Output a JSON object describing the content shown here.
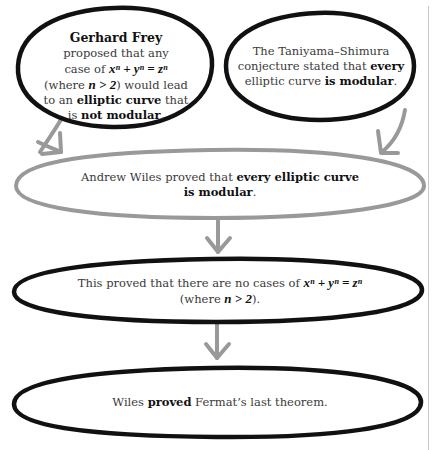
{
  "colors": {
    "black_outline": "#111111",
    "gray_outline": "#999999",
    "arrow": "#999999",
    "text": "#3a3a3a",
    "bold_text": "#111111",
    "divider": "#c8c8c8"
  },
  "nodes": {
    "frey": {
      "title": "Gerhard Frey",
      "line1": "proposed that any",
      "line2_prefix": "case of ",
      "equation": "xⁿ + yⁿ = zⁿ",
      "line3_prefix": "(where ",
      "condition": "n > 2",
      "line3_suffix": ") would lead",
      "line4_prefix": "to an ",
      "line4_bold": "elliptic curve",
      "line4_suffix": " that",
      "line5_prefix": "is ",
      "line5_bold": "not modular",
      "line5_suffix": "."
    },
    "taniyama": {
      "line1": "The Taniyama–Shimura",
      "line2_prefix": "conjecture stated that ",
      "line2_bold": "every",
      "line3_prefix": "elliptic curve ",
      "line3_bold": "is modular",
      "line3_suffix": "."
    },
    "wiles_modular": {
      "prefix": "Andrew Wiles proved that ",
      "bold1": "every elliptic curve",
      "bold2": "is modular",
      "suffix": "."
    },
    "no_cases": {
      "prefix": "This proved that there are no cases of ",
      "equation": "xⁿ + yⁿ = zⁿ",
      "line2_prefix": "(where ",
      "condition": "n > 2",
      "line2_suffix": ")."
    },
    "fermat": {
      "prefix": "Wiles ",
      "bold": "proved",
      "suffix": " Fermat’s last theorem."
    }
  },
  "edges": [
    {
      "from": "frey",
      "to": "wiles_modular"
    },
    {
      "from": "taniyama",
      "to": "wiles_modular"
    },
    {
      "from": "wiles_modular",
      "to": "no_cases"
    },
    {
      "from": "no_cases",
      "to": "fermat"
    }
  ]
}
